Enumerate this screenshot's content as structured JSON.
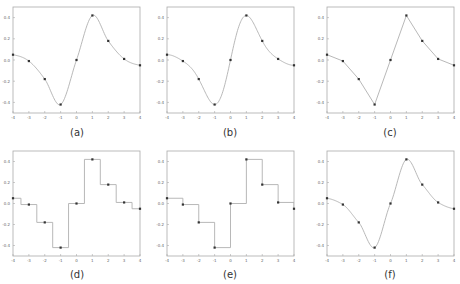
{
  "figure": {
    "panel_captions": [
      "(a)",
      "(b)",
      "(c)",
      "(d)",
      "(e)",
      "(f)"
    ],
    "colors": {
      "frame": "#aaaaaa",
      "curve": "#b0b0b0",
      "marker": "#333333",
      "tick_text": "#666666"
    }
  },
  "chart_data": [
    {
      "panel": "(a)",
      "type": "line",
      "interpolation": "smooth-spline",
      "x": [
        -4,
        -3,
        -2,
        -1,
        0,
        1,
        2,
        3,
        4
      ],
      "values": [
        0.05,
        -0.01,
        -0.18,
        -0.42,
        0.0,
        0.42,
        0.18,
        0.01,
        -0.05
      ],
      "xlim": [
        -4,
        4
      ],
      "ylim": [
        -0.5,
        0.5
      ],
      "xticks": [
        "-4",
        "-3",
        "-2",
        "-1",
        "0",
        "1",
        "2",
        "3",
        "4"
      ],
      "yticks": [
        "0.4",
        "0.2",
        "0.0",
        "-0.2",
        "-0.4"
      ],
      "title": "",
      "xlabel": "",
      "ylabel": "",
      "grid": false
    },
    {
      "panel": "(b)",
      "type": "line",
      "interpolation": "oscillatory",
      "x": [
        -4,
        -3,
        -2,
        -1,
        0,
        1,
        2,
        3,
        4
      ],
      "values": [
        0.05,
        -0.01,
        -0.18,
        -0.42,
        0.0,
        0.42,
        0.18,
        0.01,
        -0.05
      ],
      "xlim": [
        -4,
        4
      ],
      "ylim": [
        -0.5,
        0.5
      ],
      "xticks": [
        "-4",
        "-3",
        "-2",
        "-1",
        "0",
        "1",
        "2",
        "3",
        "4"
      ],
      "yticks": [
        "0.4",
        "0.2",
        "0.0",
        "-0.2",
        "-0.4"
      ],
      "title": "",
      "xlabel": "",
      "ylabel": "",
      "grid": false
    },
    {
      "panel": "(c)",
      "type": "line",
      "interpolation": "linear",
      "x": [
        -4,
        -3,
        -2,
        -1,
        0,
        1,
        2,
        3,
        4
      ],
      "values": [
        0.05,
        -0.01,
        -0.18,
        -0.42,
        0.0,
        0.42,
        0.18,
        0.01,
        -0.05
      ],
      "xlim": [
        -4,
        4
      ],
      "ylim": [
        -0.5,
        0.5
      ],
      "xticks": [
        "-4",
        "-3",
        "-2",
        "-1",
        "0",
        "1",
        "2",
        "3",
        "4"
      ],
      "yticks": [
        "0.4",
        "0.2",
        "0.0",
        "-0.2",
        "-0.4"
      ],
      "title": "",
      "xlabel": "",
      "ylabel": "",
      "grid": false
    },
    {
      "panel": "(d)",
      "type": "line",
      "interpolation": "nearest-step",
      "x": [
        -4,
        -3,
        -2,
        -1,
        0,
        1,
        2,
        3,
        4
      ],
      "values": [
        0.05,
        -0.01,
        -0.18,
        -0.42,
        0.0,
        0.42,
        0.18,
        0.01,
        -0.05
      ],
      "xlim": [
        -4,
        4
      ],
      "ylim": [
        -0.5,
        0.5
      ],
      "xticks": [
        "-4",
        "-3",
        "-2",
        "-1",
        "0",
        "1",
        "2",
        "3",
        "4"
      ],
      "yticks": [
        "0.4",
        "0.2",
        "0.0",
        "-0.2",
        "-0.4"
      ],
      "title": "",
      "xlabel": "",
      "ylabel": "",
      "grid": false
    },
    {
      "panel": "(e)",
      "type": "line",
      "interpolation": "zero-order-hold-step",
      "x": [
        -4,
        -3,
        -2,
        -1,
        0,
        1,
        2,
        3,
        4
      ],
      "values": [
        0.05,
        -0.01,
        -0.18,
        -0.42,
        0.0,
        0.42,
        0.18,
        0.01,
        -0.05
      ],
      "xlim": [
        -4,
        4
      ],
      "ylim": [
        -0.5,
        0.5
      ],
      "xticks": [
        "-4",
        "-3",
        "-2",
        "-1",
        "0",
        "1",
        "2",
        "3",
        "4"
      ],
      "yticks": [
        "0.4",
        "0.2",
        "0.0",
        "-0.2",
        "-0.4"
      ],
      "title": "",
      "xlabel": "",
      "ylabel": "",
      "grid": false
    },
    {
      "panel": "(f)",
      "type": "line",
      "interpolation": "smooth-cubic",
      "x": [
        -4,
        -3,
        -2,
        -1,
        0,
        1,
        2,
        3,
        4
      ],
      "values": [
        0.05,
        -0.01,
        -0.18,
        -0.42,
        0.0,
        0.42,
        0.18,
        0.01,
        -0.05
      ],
      "xlim": [
        -4,
        4
      ],
      "ylim": [
        -0.5,
        0.5
      ],
      "xticks": [
        "-4",
        "-3",
        "-2",
        "-1",
        "0",
        "1",
        "2",
        "3",
        "4"
      ],
      "yticks": [
        "0.4",
        "0.2",
        "0.0",
        "-0.2",
        "-0.4"
      ],
      "title": "",
      "xlabel": "",
      "ylabel": "",
      "grid": false
    }
  ]
}
